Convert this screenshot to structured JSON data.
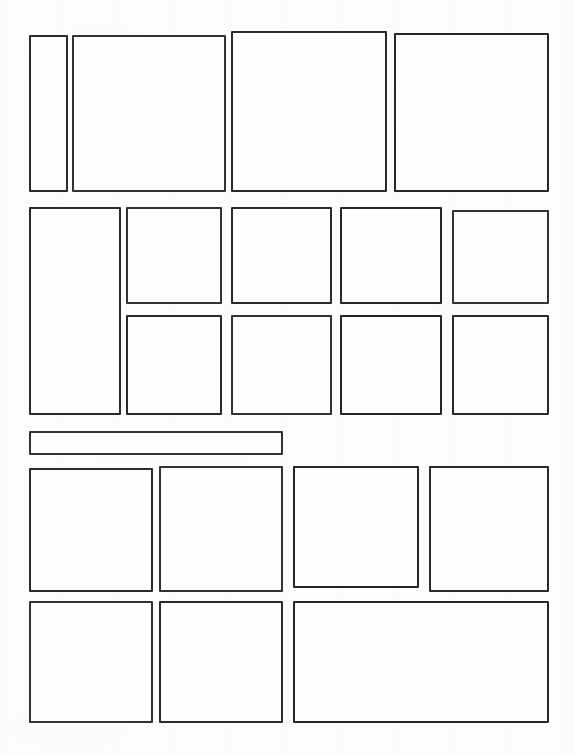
{
  "page": {
    "document_type": "scanned-page",
    "width_px": 575,
    "height_px": 755,
    "background_color": "#fdfdfd",
    "ink_color": "#2b2b2b",
    "frame_fill_color": "#fefefe",
    "border_width_px": 2,
    "content_text": ""
  },
  "bands": [
    {
      "id": "band-1",
      "label": "Top band",
      "frame_count": 4
    },
    {
      "id": "band-2",
      "label": "Second band",
      "frame_count": 9
    },
    {
      "id": "band-3",
      "label": "Wide bar band",
      "frame_count": 1
    },
    {
      "id": "band-4",
      "label": "Third band",
      "frame_count": 4
    },
    {
      "id": "band-5",
      "label": "Bottom band",
      "frame_count": 3
    }
  ],
  "frames": [
    {
      "id": "frame-1-1",
      "band": "band-1",
      "x": 29,
      "y": 35,
      "w": 39,
      "h": 157,
      "ink": "ink-a",
      "label": ""
    },
    {
      "id": "frame-1-2",
      "band": "band-1",
      "x": 72,
      "y": 35,
      "w": 154,
      "h": 157,
      "ink": "ink-b",
      "label": ""
    },
    {
      "id": "frame-1-3",
      "band": "band-1",
      "x": 231,
      "y": 31,
      "w": 156,
      "h": 161,
      "ink": "ink-a",
      "label": ""
    },
    {
      "id": "frame-1-4",
      "band": "band-1",
      "x": 394,
      "y": 33,
      "w": 155,
      "h": 159,
      "ink": "ink-c",
      "label": ""
    },
    {
      "id": "frame-2-1",
      "band": "band-2",
      "x": 29,
      "y": 207,
      "w": 92,
      "h": 208,
      "ink": "ink-a",
      "label": ""
    },
    {
      "id": "frame-2-2",
      "band": "band-2",
      "x": 126,
      "y": 207,
      "w": 96,
      "h": 97,
      "ink": "ink-b",
      "label": ""
    },
    {
      "id": "frame-2-3",
      "band": "band-2",
      "x": 231,
      "y": 207,
      "w": 101,
      "h": 97,
      "ink": "ink-a",
      "label": ""
    },
    {
      "id": "frame-2-4",
      "band": "band-2",
      "x": 340,
      "y": 207,
      "w": 102,
      "h": 97,
      "ink": "ink-c",
      "label": ""
    },
    {
      "id": "frame-2-5",
      "band": "band-2",
      "x": 452,
      "y": 210,
      "w": 97,
      "h": 94,
      "ink": "ink-b",
      "label": ""
    },
    {
      "id": "frame-2-6",
      "band": "band-2",
      "x": 126,
      "y": 315,
      "w": 96,
      "h": 100,
      "ink": "ink-a",
      "label": ""
    },
    {
      "id": "frame-2-7",
      "band": "band-2",
      "x": 231,
      "y": 315,
      "w": 101,
      "h": 100,
      "ink": "ink-b",
      "label": ""
    },
    {
      "id": "frame-2-8",
      "band": "band-2",
      "x": 340,
      "y": 315,
      "w": 102,
      "h": 100,
      "ink": "ink-c",
      "label": ""
    },
    {
      "id": "frame-2-9",
      "band": "band-2",
      "x": 452,
      "y": 315,
      "w": 97,
      "h": 100,
      "ink": "ink-a",
      "label": ""
    },
    {
      "id": "frame-3-1",
      "band": "band-3",
      "x": 29,
      "y": 431,
      "w": 254,
      "h": 24,
      "ink": "ink-b",
      "label": ""
    },
    {
      "id": "frame-4-1",
      "band": "band-4",
      "x": 29,
      "y": 468,
      "w": 124,
      "h": 124,
      "ink": "ink-a",
      "label": ""
    },
    {
      "id": "frame-4-2",
      "band": "band-4",
      "x": 159,
      "y": 466,
      "w": 124,
      "h": 126,
      "ink": "ink-b",
      "label": ""
    },
    {
      "id": "frame-4-3",
      "band": "band-4",
      "x": 293,
      "y": 466,
      "w": 126,
      "h": 122,
      "ink": "ink-c",
      "label": ""
    },
    {
      "id": "frame-4-4",
      "band": "band-4",
      "x": 429,
      "y": 466,
      "w": 120,
      "h": 126,
      "ink": "ink-a",
      "label": ""
    },
    {
      "id": "frame-5-1",
      "band": "band-5",
      "x": 29,
      "y": 601,
      "w": 124,
      "h": 122,
      "ink": "ink-b",
      "label": ""
    },
    {
      "id": "frame-5-2",
      "band": "band-5",
      "x": 159,
      "y": 601,
      "w": 124,
      "h": 122,
      "ink": "ink-a",
      "label": ""
    },
    {
      "id": "frame-5-3",
      "band": "band-5",
      "x": 293,
      "y": 601,
      "w": 256,
      "h": 122,
      "ink": "ink-c",
      "label": ""
    }
  ]
}
